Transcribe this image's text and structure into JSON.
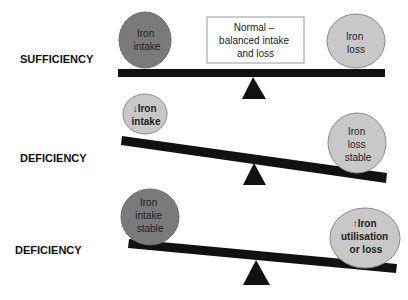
{
  "diagram": {
    "colors": {
      "dark_circle": "#7a7a7a",
      "light_circle": "#c8c8c8",
      "circle_stroke": "#8a8a8a",
      "beam": "#111111",
      "fulcrum": "#111111",
      "box_stroke": "#9a9a9a"
    },
    "scales": [
      {
        "label": "SUFFICIENCY",
        "state": "balanced",
        "left": {
          "lines": [
            "Iron",
            "intake"
          ],
          "shade": "dark"
        },
        "center_box": {
          "lines": [
            "Normal –",
            "balanced intake",
            "and loss"
          ]
        },
        "right": {
          "lines": [
            "Iron",
            "loss"
          ],
          "shade": "light"
        }
      },
      {
        "label": "DEFICIENCY",
        "state": "tilted-right",
        "left": {
          "lines": [
            "↓Iron",
            "intake"
          ],
          "shade": "light"
        },
        "right": {
          "lines": [
            "Iron",
            "loss",
            "stable"
          ],
          "shade": "light"
        }
      },
      {
        "label": "DEFICIENCY",
        "state": "tilted-right",
        "left": {
          "lines": [
            "Iron",
            "intake",
            "stable"
          ],
          "shade": "dark"
        },
        "right": {
          "lines": [
            "↑Iron",
            "utilisation",
            "or loss"
          ],
          "shade": "light"
        }
      }
    ]
  }
}
